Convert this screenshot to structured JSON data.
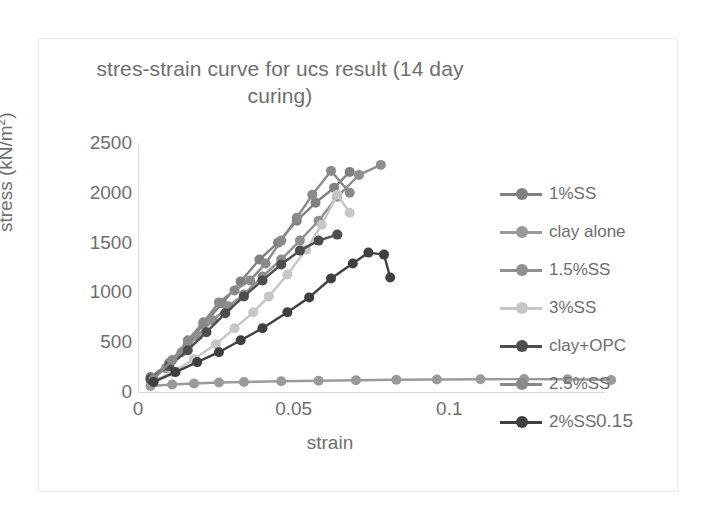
{
  "chart_data": {
    "type": "line",
    "title": "stres-strain curve for ucs result (14 day curing)",
    "xlabel": "strain",
    "ylabel": "stress (kN/m²)",
    "xlim": [
      0,
      0.15
    ],
    "ylim": [
      0,
      2500
    ],
    "xticks": [
      "0",
      "0.05",
      "0.1",
      "0.15"
    ],
    "xtick_values": [
      0,
      0.05,
      0.1,
      0.15
    ],
    "yticks": [
      "0",
      "500",
      "1000",
      "1500",
      "2000",
      "2500"
    ],
    "ytick_values": [
      0,
      500,
      1000,
      1500,
      2000,
      2500
    ],
    "grid": false,
    "legend_position": "right",
    "marker": "circle",
    "series": [
      {
        "name": "1%SS",
        "color": "#808080",
        "points": [
          [
            0.004,
            150
          ],
          [
            0.01,
            290
          ],
          [
            0.016,
            480
          ],
          [
            0.021,
            680
          ],
          [
            0.027,
            890
          ],
          [
            0.033,
            1110
          ],
          [
            0.039,
            1330
          ],
          [
            0.045,
            1500
          ],
          [
            0.051,
            1720
          ],
          [
            0.057,
            1900
          ],
          [
            0.063,
            2050
          ],
          [
            0.068,
            2210
          ]
        ]
      },
      {
        "name": "clay alone",
        "color": "#9a9a9a",
        "points": [
          [
            0.004,
            60
          ],
          [
            0.011,
            75
          ],
          [
            0.018,
            85
          ],
          [
            0.026,
            95
          ],
          [
            0.034,
            100
          ],
          [
            0.046,
            108
          ],
          [
            0.058,
            112
          ],
          [
            0.07,
            118
          ],
          [
            0.083,
            122
          ],
          [
            0.096,
            126
          ],
          [
            0.11,
            128
          ],
          [
            0.124,
            130
          ],
          [
            0.138,
            128
          ],
          [
            0.152,
            120
          ]
        ]
      },
      {
        "name": "1.5%SS",
        "color": "#8f8f8f",
        "points": [
          [
            0.004,
            120
          ],
          [
            0.009,
            240
          ],
          [
            0.014,
            400
          ],
          [
            0.019,
            560
          ],
          [
            0.024,
            720
          ],
          [
            0.029,
            860
          ],
          [
            0.034,
            980
          ],
          [
            0.04,
            1160
          ],
          [
            0.046,
            1330
          ],
          [
            0.052,
            1520
          ],
          [
            0.058,
            1720
          ],
          [
            0.064,
            1960
          ],
          [
            0.071,
            2180
          ],
          [
            0.078,
            2280
          ]
        ]
      },
      {
        "name": "3%SS",
        "color": "#c6c6c6",
        "points": [
          [
            0.005,
            110
          ],
          [
            0.011,
            200
          ],
          [
            0.018,
            330
          ],
          [
            0.025,
            480
          ],
          [
            0.031,
            640
          ],
          [
            0.037,
            800
          ],
          [
            0.042,
            960
          ],
          [
            0.048,
            1180
          ],
          [
            0.054,
            1430
          ],
          [
            0.059,
            1680
          ],
          [
            0.064,
            1980
          ],
          [
            0.068,
            1800
          ]
        ]
      },
      {
        "name": "clay+OPC",
        "color": "#4d4d4d",
        "points": [
          [
            0.004,
            130
          ],
          [
            0.01,
            260
          ],
          [
            0.016,
            420
          ],
          [
            0.022,
            600
          ],
          [
            0.028,
            790
          ],
          [
            0.034,
            960
          ],
          [
            0.04,
            1120
          ],
          [
            0.046,
            1280
          ],
          [
            0.052,
            1420
          ],
          [
            0.058,
            1520
          ],
          [
            0.064,
            1580
          ]
        ]
      },
      {
        "name": "2.5%SS",
        "color": "#8a8a8a",
        "points": [
          [
            0.005,
            130
          ],
          [
            0.011,
            320
          ],
          [
            0.016,
            520
          ],
          [
            0.021,
            700
          ],
          [
            0.026,
            900
          ],
          [
            0.031,
            1020
          ],
          [
            0.036,
            1120
          ],
          [
            0.041,
            1290
          ],
          [
            0.046,
            1520
          ],
          [
            0.051,
            1750
          ],
          [
            0.056,
            1980
          ],
          [
            0.062,
            2220
          ],
          [
            0.068,
            2000
          ]
        ]
      },
      {
        "name": "2%SS",
        "color": "#404040",
        "points": [
          [
            0.005,
            100
          ],
          [
            0.012,
            200
          ],
          [
            0.019,
            300
          ],
          [
            0.026,
            400
          ],
          [
            0.033,
            520
          ],
          [
            0.04,
            640
          ],
          [
            0.048,
            800
          ],
          [
            0.055,
            950
          ],
          [
            0.062,
            1140
          ],
          [
            0.069,
            1290
          ],
          [
            0.074,
            1400
          ],
          [
            0.079,
            1380
          ],
          [
            0.081,
            1150
          ]
        ]
      }
    ]
  },
  "legend": {
    "items": [
      {
        "label": "1%SS",
        "color": "#808080"
      },
      {
        "label": "clay alone",
        "color": "#9a9a9a"
      },
      {
        "label": "1.5%SS",
        "color": "#8f8f8f"
      },
      {
        "label": "3%SS",
        "color": "#c6c6c6"
      },
      {
        "label": "clay+OPC",
        "color": "#4d4d4d"
      },
      {
        "label": "2.5%SS",
        "color": "#8a8a8a"
      },
      {
        "label": "2%SS",
        "color": "#404040"
      }
    ]
  },
  "overlap_tick": "0.15"
}
